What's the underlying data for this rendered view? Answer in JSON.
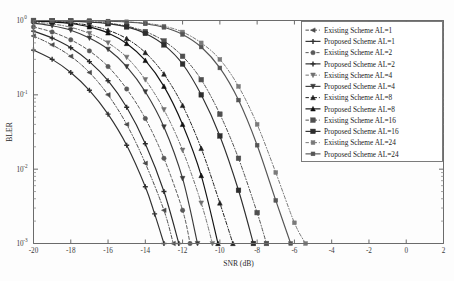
{
  "chart_data": {
    "type": "line",
    "title": "",
    "xlabel": "SNR (dB)",
    "ylabel": "BLER",
    "xlim": [
      -20,
      2
    ],
    "ylim": [
      0.001,
      1
    ],
    "yscale": "log",
    "grid": false,
    "legend_position": "right",
    "xticks": [
      -20,
      -18,
      -16,
      -14,
      -12,
      -10,
      -8,
      -6,
      -4,
      -2,
      0,
      2
    ],
    "xticklabels": [
      "-20",
      "-18",
      "-16",
      "-14",
      "-12",
      "-10",
      "-8",
      "-6",
      "-4",
      "-2",
      "0",
      "2"
    ],
    "yticks": [
      1,
      0.1,
      0.01,
      0.001
    ],
    "yticklabels": [
      "10^0",
      "10^-1",
      "10^-2",
      "10^-3"
    ],
    "series": [
      {
        "name": "Existing Scheme AL=1",
        "marker": "triangle-left",
        "linestyle": "dashdot",
        "color": "#4a4a4a",
        "x": [
          -20,
          -19,
          -18,
          -17,
          -16,
          -15,
          -14,
          -13,
          -12.5
        ],
        "y": [
          0.62,
          0.47,
          0.33,
          0.2,
          0.1,
          0.04,
          0.012,
          0.0028,
          0.001
        ]
      },
      {
        "name": "Proposed Scheme AL=1",
        "marker": "plus",
        "linestyle": "solid",
        "color": "#303030",
        "x": [
          -20,
          -19,
          -18,
          -17,
          -16,
          -15,
          -14,
          -13.5,
          -13
        ],
        "y": [
          0.4,
          0.3,
          0.2,
          0.115,
          0.055,
          0.021,
          0.0058,
          0.0025,
          0.001
        ]
      },
      {
        "name": "Existing Scheme AL=2",
        "marker": "circle",
        "linestyle": "dashed",
        "color": "#5a5a5a",
        "x": [
          -20,
          -19,
          -18,
          -17,
          -16,
          -15,
          -14,
          -13,
          -12,
          -11.6
        ],
        "y": [
          0.82,
          0.7,
          0.55,
          0.39,
          0.24,
          0.12,
          0.048,
          0.014,
          0.0028,
          0.001
        ]
      },
      {
        "name": "Proposed Scheme AL=2",
        "marker": "plus-bold",
        "linestyle": "solid",
        "color": "#2a2a2a",
        "x": [
          -20,
          -19,
          -18,
          -17,
          -16,
          -15,
          -14,
          -13,
          -12.2
        ],
        "y": [
          0.72,
          0.58,
          0.43,
          0.28,
          0.155,
          0.068,
          0.022,
          0.005,
          0.001
        ]
      },
      {
        "name": "Existing Scheme AL=4",
        "marker": "triangle-down",
        "linestyle": "dashdot",
        "color": "#707070",
        "x": [
          -20,
          -19,
          -18,
          -17,
          -16,
          -15,
          -14,
          -13,
          -12,
          -11,
          -10.4
        ],
        "y": [
          0.95,
          0.9,
          0.81,
          0.67,
          0.5,
          0.32,
          0.16,
          0.063,
          0.018,
          0.0035,
          0.001
        ]
      },
      {
        "name": "Proposed Scheme AL=4",
        "marker": "triangle-down-bold",
        "linestyle": "solid",
        "color": "#3a3a3a",
        "x": [
          -20,
          -19,
          -18,
          -17,
          -16,
          -15,
          -14,
          -13,
          -12,
          -11.2
        ],
        "y": [
          0.92,
          0.85,
          0.74,
          0.58,
          0.41,
          0.24,
          0.11,
          0.037,
          0.0075,
          0.001
        ]
      },
      {
        "name": "Existing Scheme AL=8",
        "marker": "triangle-up",
        "linestyle": "dashdot",
        "color": "#1f1f1f",
        "x": [
          -20,
          -19,
          -18,
          -17,
          -16,
          -15,
          -14,
          -13,
          -12,
          -11,
          -10,
          -9.3
        ],
        "y": [
          0.99,
          0.97,
          0.93,
          0.86,
          0.74,
          0.57,
          0.37,
          0.19,
          0.072,
          0.019,
          0.0035,
          0.001
        ]
      },
      {
        "name": "Proposed Scheme AL=8",
        "marker": "triangle-up-bold",
        "linestyle": "solid",
        "color": "#111111",
        "x": [
          -20,
          -19,
          -18,
          -17,
          -16,
          -15,
          -14,
          -13,
          -12,
          -11,
          -10.1
        ],
        "y": [
          0.985,
          0.96,
          0.91,
          0.82,
          0.68,
          0.49,
          0.29,
          0.13,
          0.04,
          0.0082,
          0.001
        ]
      },
      {
        "name": "Existing Scheme AL=16",
        "marker": "square",
        "linestyle": "dashdot",
        "color": "#4f4f4f",
        "x": [
          -20,
          -19,
          -18,
          -17,
          -16,
          -15,
          -14,
          -13,
          -12,
          -11,
          -10,
          -9,
          -8,
          -7.5
        ],
        "y": [
          1.0,
          0.995,
          0.985,
          0.96,
          0.92,
          0.84,
          0.71,
          0.53,
          0.33,
          0.16,
          0.055,
          0.014,
          0.0026,
          0.001
        ]
      },
      {
        "name": "Proposed Scheme AL=16",
        "marker": "square-bold",
        "linestyle": "solid",
        "color": "#2e2e2e",
        "x": [
          -20,
          -19,
          -18,
          -17,
          -16,
          -15,
          -14,
          -13,
          -12,
          -11,
          -10,
          -9,
          -8.2
        ],
        "y": [
          1.0,
          0.995,
          0.982,
          0.955,
          0.905,
          0.82,
          0.67,
          0.47,
          0.26,
          0.1,
          0.028,
          0.0052,
          0.001
        ]
      },
      {
        "name": "Existing Scheme AL=24",
        "marker": "square-small",
        "linestyle": "dashdot",
        "color": "#7a7a7a",
        "x": [
          -20,
          -19,
          -18,
          -17,
          -16,
          -15,
          -14,
          -13,
          -12,
          -11,
          -10,
          -9,
          -8,
          -7,
          -6,
          -5.4
        ],
        "y": [
          1.0,
          1.0,
          0.998,
          0.993,
          0.982,
          0.96,
          0.92,
          0.84,
          0.7,
          0.5,
          0.3,
          0.13,
          0.04,
          0.009,
          0.0019,
          0.001
        ]
      },
      {
        "name": "Proposed Scheme AL=24",
        "marker": "square-small-bold",
        "linestyle": "solid",
        "color": "#555555",
        "x": [
          -20,
          -19,
          -18,
          -17,
          -16,
          -15,
          -14,
          -13,
          -12,
          -11,
          -10,
          -9,
          -8,
          -7,
          -6.2
        ],
        "y": [
          1.0,
          1.0,
          0.998,
          0.992,
          0.979,
          0.955,
          0.905,
          0.81,
          0.65,
          0.44,
          0.23,
          0.085,
          0.021,
          0.0038,
          0.001
        ]
      }
    ]
  },
  "legend": {
    "items": [
      {
        "label": "Existing Scheme AL=1"
      },
      {
        "label": "Proposed Scheme AL=1"
      },
      {
        "label": "Existing Scheme AL=2"
      },
      {
        "label": "Proposed Scheme AL=2"
      },
      {
        "label": "Existing Scheme AL=4"
      },
      {
        "label": "Proposed Scheme AL=4"
      },
      {
        "label": "Existing Scheme AL=8"
      },
      {
        "label": "Proposed Scheme AL=8"
      },
      {
        "label": "Existing Scheme AL=16"
      },
      {
        "label": "Proposed Scheme AL=16"
      },
      {
        "label": "Existing Scheme AL=24"
      },
      {
        "label": "Proposed Scheme AL=24"
      }
    ]
  },
  "axes": {
    "ylabel": "BLER",
    "xlabel": "SNR (dB)",
    "y_exp_labels": [
      {
        "base": "10",
        "exp": "0"
      },
      {
        "base": "10",
        "exp": "-1"
      },
      {
        "base": "10",
        "exp": "-2"
      },
      {
        "base": "10",
        "exp": "-3"
      }
    ],
    "x_tick_labels": [
      "-20",
      "-18",
      "-16",
      "-14",
      "-12",
      "-10",
      "-8",
      "-6",
      "-4",
      "-2",
      "0",
      "2"
    ]
  }
}
